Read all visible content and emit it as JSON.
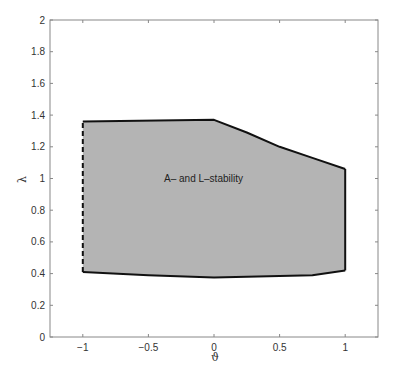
{
  "chart_data": {
    "type": "area",
    "title": "",
    "xlabel": "ϑ",
    "ylabel": "λ",
    "xlim": [
      -1.25,
      1.25
    ],
    "ylim": [
      0,
      2
    ],
    "grid": false,
    "legend": null,
    "x_ticks": [
      -1,
      -0.5,
      0,
      0.5,
      1
    ],
    "x_tick_labels": [
      "−1",
      "−0.5",
      "0",
      "0.5",
      "1"
    ],
    "y_ticks": [
      0,
      0.2,
      0.4,
      0.6,
      0.8,
      1,
      1.2,
      1.4,
      1.6,
      1.8,
      2
    ],
    "y_tick_labels": [
      "0",
      "0.2",
      "0.4",
      "0.6",
      "0.8",
      "1",
      "1.2",
      "1.4",
      "1.6",
      "1.8",
      "2"
    ],
    "region": {
      "name": "A- and L-stability",
      "fill_color": "#b4b4b4",
      "upper_boundary": {
        "x": [
          -1,
          0,
          0.25,
          0.5,
          0.75,
          1
        ],
        "y": [
          1.36,
          1.37,
          1.29,
          1.2,
          1.13,
          1.06
        ]
      },
      "lower_boundary": {
        "x": [
          -1,
          -0.5,
          0,
          0.5,
          0.75,
          1
        ],
        "y": [
          0.41,
          0.39,
          0.375,
          0.385,
          0.39,
          0.42
        ]
      },
      "left_boundary": {
        "x": -1,
        "y_range": [
          0.41,
          1.36
        ],
        "style": "dashed"
      },
      "right_boundary": {
        "x": 1,
        "y_range": [
          0.42,
          1.06
        ],
        "style": "solid"
      }
    },
    "annotations": [
      {
        "text": "A– and L–stability",
        "x": -0.08,
        "y": 1.0
      }
    ]
  },
  "labels": {
    "xlabel": "ϑ",
    "ylabel": "λ",
    "region_label": "A– and L–stability"
  }
}
